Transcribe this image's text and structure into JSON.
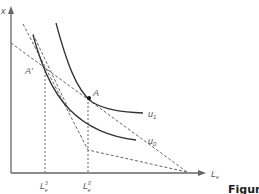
{
  "diagram": {
    "y_axis_label": "x",
    "x_axis_label_main": "L",
    "x_axis_label_sub": "e",
    "curves": [
      {
        "id": "u1",
        "label_main": "u",
        "label_sub": "1"
      },
      {
        "id": "u0",
        "label_main": "u",
        "label_sub": "0"
      }
    ],
    "points": [
      {
        "id": "A",
        "label": "A"
      },
      {
        "id": "A-prime",
        "label": "A′"
      }
    ],
    "x_ticks": [
      {
        "id": "L3",
        "main": "L",
        "sup": "3",
        "sub": "e"
      },
      {
        "id": "L0",
        "main": "L",
        "sup": "0",
        "sub": "e"
      }
    ],
    "caption_fragment": "Figur"
  },
  "colors": {
    "axis": "#555555",
    "curve": "#333333",
    "dashed": "#666666",
    "point": "#111111"
  }
}
